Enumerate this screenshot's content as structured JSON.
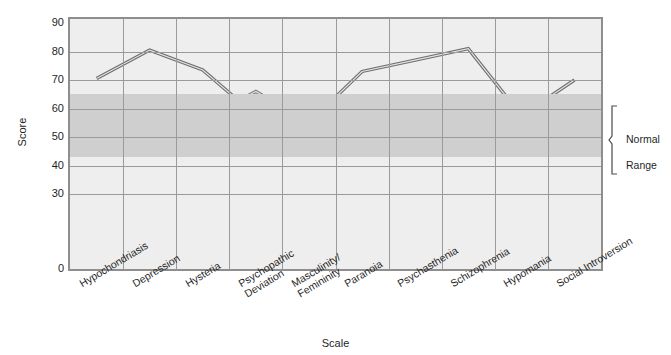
{
  "chart_data": {
    "type": "line",
    "title": "",
    "xlabel": "Scale",
    "ylabel": "Score",
    "ylim": [
      0,
      90
    ],
    "grid": true,
    "legend_position": "none",
    "y_ticks": [
      90,
      80,
      70,
      60,
      50,
      40,
      30,
      0
    ],
    "axis_break": "between 30 and 0",
    "categories": [
      "Hypochondriasis",
      "Depression",
      "Hysteria",
      "Psychopathic\nDeviation",
      "Masculinity/\nFemininity",
      "Paranoia",
      "Psychasthenia",
      "Schizophrenia",
      "Hypomania",
      "Social Introversion"
    ],
    "series": [
      {
        "name": "Profile 1",
        "color": "#6e6e6e",
        "values": [
          70.5,
          80.5,
          73.5,
          57.5,
          55.0,
          73.0,
          77.0,
          81.0,
          57.5,
          70.0
        ]
      },
      {
        "name": "Profile 2",
        "color": "#7c7c7c",
        "values": [
          55.0,
          56.0,
          56.0,
          66.0,
          55.0,
          55.5,
          57.5,
          53.5,
          55.5,
          61.5
        ]
      },
      {
        "name": "Profile 3",
        "color": "#555555",
        "values": [
          52.5,
          53.5,
          51.0,
          55.5,
          50.0,
          55.0,
          55.5,
          57.0,
          55.0,
          48.0
        ]
      }
    ],
    "annotations": [
      {
        "name": "normal-range",
        "label": "Normal\nRange",
        "band_from": 43,
        "band_to": 65
      }
    ],
    "colors": {
      "plot_background": "#eeeeee",
      "band": "#cfcfcf",
      "gridline": "#9a9a9a",
      "frame": "#8e8e8e"
    }
  },
  "axis": {
    "y_title": "Score",
    "x_title": "Scale"
  },
  "annotation": {
    "normal_range_line1": "Normal",
    "normal_range_line2": "Range"
  }
}
